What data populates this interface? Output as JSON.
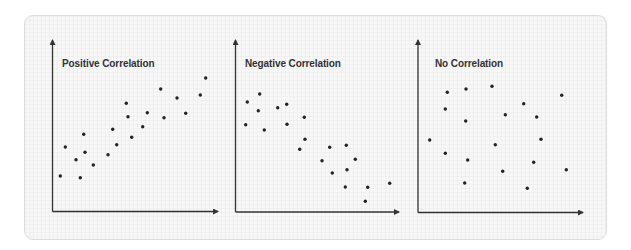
{
  "colors": {
    "page_bg": "#ffffff",
    "card_bg": "#f7f7f7",
    "card_border": "#dcdcdc",
    "axis": "#333333",
    "dot": "#222222",
    "title": "#333333"
  },
  "chart_data": [
    {
      "type": "scatter",
      "title": "Positive Correlation",
      "xlabel": "",
      "ylabel": "",
      "grid": false,
      "legend": false,
      "axes": {
        "origin": [
          52.5,
          211.5
        ],
        "x_end": 218,
        "y_end": 40
      },
      "title_pos": [
        62,
        58
      ],
      "points": [
        [
          60.3,
          176
        ],
        [
          65.3,
          147
        ],
        [
          76,
          159.7
        ],
        [
          80.3,
          177.7
        ],
        [
          83.7,
          134.3
        ],
        [
          85,
          152.3
        ],
        [
          93.3,
          165
        ],
        [
          108,
          154.7
        ],
        [
          112.7,
          129.3
        ],
        [
          116.7,
          144.7
        ],
        [
          126.3,
          103.3
        ],
        [
          128,
          116.7
        ],
        [
          131.7,
          137.3
        ],
        [
          142.7,
          126.7
        ],
        [
          147.3,
          112.7
        ],
        [
          160.7,
          89
        ],
        [
          164,
          117.7
        ],
        [
          177,
          98
        ],
        [
          185.7,
          113.3
        ],
        [
          200.3,
          95
        ],
        [
          205.7,
          78
        ]
      ]
    },
    {
      "type": "scatter",
      "title": "Negative Correlation",
      "xlabel": "",
      "ylabel": "",
      "grid": false,
      "legend": false,
      "axes": {
        "origin": [
          235.5,
          212
        ],
        "x_end": 399,
        "y_end": 40
      },
      "title_pos": [
        245,
        58
      ],
      "points": [
        [
          247.3,
          102
        ],
        [
          259.7,
          94
        ],
        [
          258.3,
          110.7
        ],
        [
          245.7,
          124.7
        ],
        [
          264.3,
          130
        ],
        [
          277.7,
          107.7
        ],
        [
          286.7,
          104.3
        ],
        [
          287,
          124.3
        ],
        [
          304.3,
          117.3
        ],
        [
          305,
          139.3
        ],
        [
          299.7,
          149.3
        ],
        [
          329.7,
          147.3
        ],
        [
          346.3,
          145.3
        ],
        [
          322,
          160.7
        ],
        [
          355.3,
          159.3
        ],
        [
          332.3,
          173
        ],
        [
          347,
          169.7
        ],
        [
          345.3,
          187
        ],
        [
          367.7,
          187.3
        ],
        [
          389.7,
          183.3
        ],
        [
          365.3,
          201.3
        ]
      ]
    },
    {
      "type": "scatter",
      "title": "No Correlation",
      "xlabel": "",
      "ylabel": "",
      "grid": false,
      "legend": false,
      "axes": {
        "origin": [
          418,
          212.5
        ],
        "x_end": 583,
        "y_end": 40
      },
      "title_pos": [
        435,
        58
      ],
      "points": [
        [
          447.3,
          92.3
        ],
        [
          466,
          89
        ],
        [
          492,
          86.3
        ],
        [
          561.7,
          95.3
        ],
        [
          445.3,
          109
        ],
        [
          523.7,
          103.7
        ],
        [
          505.3,
          114.7
        ],
        [
          536.7,
          117
        ],
        [
          465.7,
          121
        ],
        [
          429.7,
          140
        ],
        [
          495.3,
          144.7
        ],
        [
          541,
          139.3
        ],
        [
          445.3,
          153.3
        ],
        [
          467.7,
          160
        ],
        [
          533.7,
          162.3
        ],
        [
          502.7,
          171.3
        ],
        [
          566.3,
          169.7
        ],
        [
          464.7,
          183
        ],
        [
          527.3,
          188.3
        ]
      ]
    }
  ]
}
